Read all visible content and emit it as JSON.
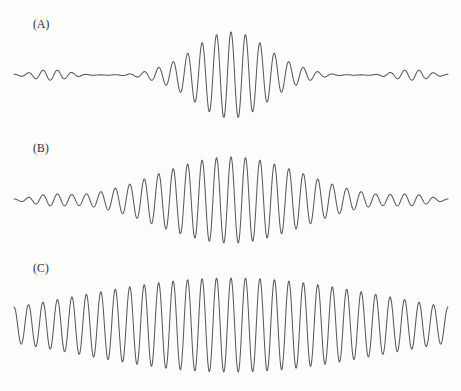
{
  "figure": {
    "background_color": "#fdfdfc",
    "line_color": "#5a5a5c",
    "width": 461,
    "height": 391
  },
  "panels": [
    {
      "id": "A",
      "label": "(A)",
      "label_x": 33,
      "label_y": 18,
      "baseline_y": 75,
      "x_start": 14,
      "x_end": 448,
      "peak_amplitude": 43,
      "carrier_cycles": 30,
      "envelope_width": 0.085,
      "side_lobe_level": 0.17,
      "packet_type": "narrow-packet-with-side-lobes"
    },
    {
      "id": "B",
      "label": "(B)",
      "label_x": 33,
      "label_y": 142,
      "baseline_y": 200,
      "x_start": 14,
      "x_end": 448,
      "peak_amplitude": 43,
      "carrier_cycles": 30,
      "envelope_width": 0.165,
      "side_lobe_level": 0.14,
      "packet_type": "medium-packet-with-side-lobes"
    },
    {
      "id": "C",
      "label": "(C)",
      "label_x": 33,
      "label_y": 262,
      "baseline_y": 325,
      "x_start": 14,
      "x_end": 448,
      "peak_amplitude": 47,
      "carrier_cycles": 30,
      "envelope_width": 0.36,
      "side_lobe_level": 0.0,
      "packet_type": "broad-packet"
    }
  ],
  "chart_data": {
    "type": "line",
    "subtitle": "",
    "xlabel": "",
    "ylabel": "",
    "grid": false,
    "legend": "none",
    "axis_visible": false,
    "x": [
      0,
      1
    ],
    "xlim": [
      0,
      1
    ],
    "ylim": [
      -1,
      1
    ],
    "series": [
      {
        "name": "(A)",
        "description": "Narrow central wave packet with low-amplitude side lobes extending to both edges; amplitude envelope is sharply peaked at the centre.",
        "carrier_cycles": 30,
        "envelope_sigma": 0.085,
        "peak_amplitude": 1.0,
        "side_lobe_amplitude": 0.17,
        "baseline_y_px": 75,
        "peak_y_px": 32,
        "trough_y_px": 118
      },
      {
        "name": "(B)",
        "description": "Intermediate wave packet: the envelope is about twice as wide as (A); high-amplitude oscillations occupy the central half of the trace with smaller residual ripples at the ends.",
        "carrier_cycles": 30,
        "envelope_sigma": 0.165,
        "peak_amplitude": 1.0,
        "side_lobe_amplitude": 0.14,
        "baseline_y_px": 200,
        "peak_y_px": 157,
        "trough_y_px": 243
      },
      {
        "name": "(C)",
        "description": "Broad wave packet: the envelope spans nearly the whole trace so oscillations of near-full amplitude fill the plot, tapering gradually toward both ends.",
        "carrier_cycles": 30,
        "envelope_sigma": 0.36,
        "peak_amplitude": 1.0,
        "side_lobe_amplitude": 0.0,
        "baseline_y_px": 325,
        "peak_y_px": 278,
        "trough_y_px": 372
      }
    ]
  }
}
